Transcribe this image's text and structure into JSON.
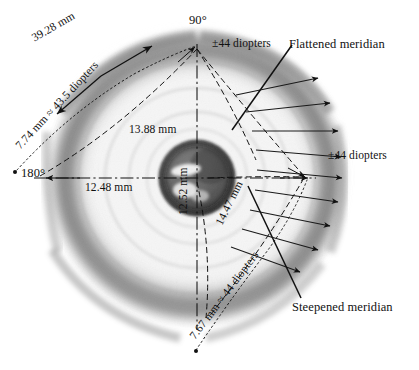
{
  "figure": {
    "kind": "corneal-topography-diagram",
    "background_color": "#ffffff",
    "ink_color": "#111111"
  },
  "annotations": {
    "axis_90": "90°",
    "axis_180": "180°",
    "arc_chord_upper_left": "39.28 mm",
    "radius_flattened": "7.74 mm ≈ 43.5 diopters",
    "chord_upper": "13.88 mm",
    "chord_horizontal": "12.48 mm",
    "chord_vertical": "12.52 mm",
    "chord_lower_right": "14.47 mm",
    "radius_steepened": "7.67 mm ≈ 44 diopters",
    "diopters_top": "±44 diopters",
    "diopters_right": "±44 diopters",
    "callout_flattened": "Flattened meridian",
    "callout_steepened": "Steepened meridian"
  },
  "measurements": {
    "flattened_meridian": {
      "radius_mm": 7.74,
      "power_diopters": 43.5,
      "arc_length_mm": 39.28,
      "chord_mm": 13.88
    },
    "steepened_meridian": {
      "radius_mm": 7.67,
      "power_diopters": 44.0,
      "chord_mm": 14.47
    },
    "horizontal_diameter_mm": 12.48,
    "vertical_diameter_mm": 12.52,
    "reference_power_diopters": 44
  },
  "geometry": {
    "center_x": 197,
    "center_y": 178,
    "iris_radius": 37,
    "globe_radius_x": 152,
    "globe_radius_y": 150
  }
}
